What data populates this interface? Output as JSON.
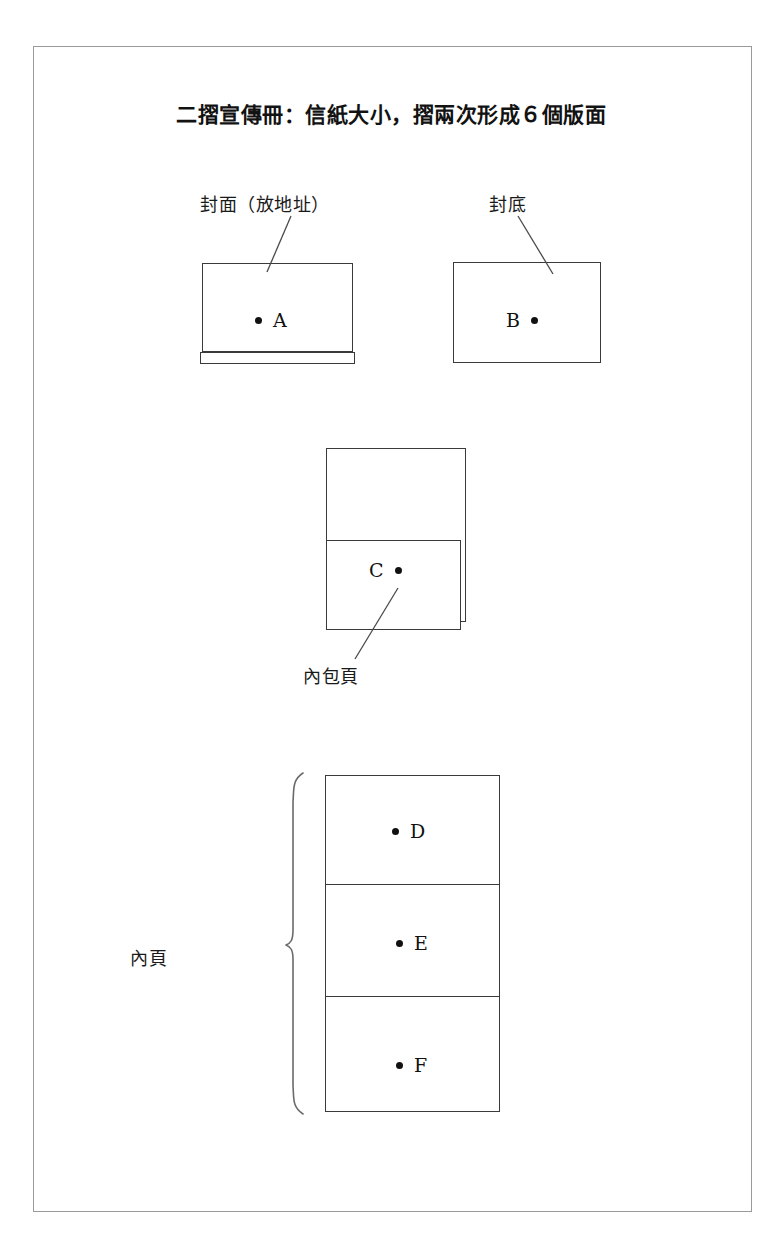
{
  "document": {
    "title": "二摺宣傳冊：信紙大小，摺兩次形成６個版面",
    "background_color": "#ffffff",
    "frame_color": "#9a9a9a",
    "line_color": "#3a3a3a",
    "text_color": "#1a1a1a"
  },
  "labels": {
    "front_cover": "封面（放地址）",
    "back_cover": "封底",
    "inner_wrap_page": "內包頁",
    "inner_pages": "內頁"
  },
  "panels": {
    "a": {
      "letter": "A",
      "bullet": "•",
      "dot_side": "left"
    },
    "b": {
      "letter": "B",
      "bullet": "•",
      "dot_side": "right"
    },
    "c": {
      "letter": "C",
      "bullet": "•",
      "dot_side": "right"
    },
    "d": {
      "letter": "D",
      "bullet": "•",
      "dot_side": "left"
    },
    "e": {
      "letter": "E",
      "bullet": "•",
      "dot_side": "left"
    },
    "f": {
      "letter": "F",
      "bullet": "•",
      "dot_side": "left"
    }
  },
  "diagram": {
    "panel_count": 6,
    "groups": [
      {
        "name": "cover-row",
        "panels": [
          "A",
          "B"
        ]
      },
      {
        "name": "wrap-page",
        "panels": [
          "C"
        ]
      },
      {
        "name": "inner-stack",
        "panels": [
          "D",
          "E",
          "F"
        ]
      }
    ]
  }
}
